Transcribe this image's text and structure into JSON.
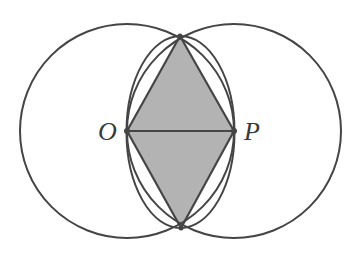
{
  "diagram": {
    "type": "geometric-construction",
    "colors": {
      "stroke": "#454545",
      "fill": "#b3b3b3",
      "background": "#ffffff"
    },
    "labels": {
      "o": "O",
      "p": "P"
    },
    "points": {
      "O": [
        127,
        131
      ],
      "P": [
        234,
        131
      ],
      "top": [
        180,
        36
      ],
      "bottom": [
        181,
        228
      ]
    },
    "circles": [
      {
        "name": "circle-centered-o",
        "cx": 127,
        "cy": 131,
        "r": 107
      },
      {
        "name": "circle-centered-p",
        "cx": 234,
        "cy": 131,
        "r": 107
      }
    ],
    "inner_ellipse": {
      "cx": 180.5,
      "cy": 132,
      "rx": 54,
      "ry": 96
    }
  }
}
